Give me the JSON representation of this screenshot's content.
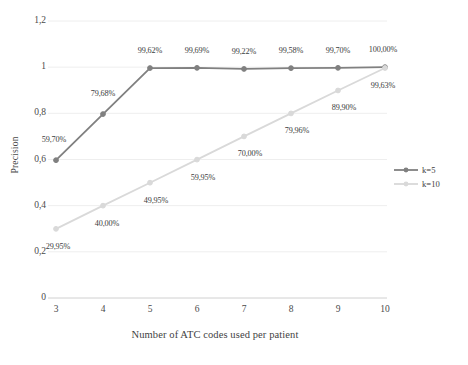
{
  "chart_data": {
    "type": "line",
    "title": "",
    "xlabel": "Number of ATC codes used per patient",
    "ylabel": "Precision",
    "x": [
      3,
      4,
      5,
      6,
      7,
      8,
      9,
      10
    ],
    "categories": [
      "3",
      "4",
      "5",
      "6",
      "7",
      "8",
      "9",
      "10"
    ],
    "xlim": [
      3,
      10
    ],
    "ylim": [
      0,
      1.2
    ],
    "yticks": [
      0,
      0.2,
      0.4,
      0.6,
      0.8,
      1,
      1.2
    ],
    "ytick_labels": [
      "0",
      "0,2",
      "0,4",
      "0,6",
      "0,8",
      "1",
      "1,2"
    ],
    "grid": "horizontal",
    "legend_position": "right",
    "series": [
      {
        "name": "k=5",
        "color": "#808080",
        "marker": "circle",
        "values": [
          0.597,
          0.7968,
          0.9962,
          0.9969,
          0.9922,
          0.9958,
          0.997,
          1.0
        ],
        "labels": [
          "59,70%",
          "79,68%",
          "99,62%",
          "99,69%",
          "99,22%",
          "99,58%",
          "99,70%",
          "100,00%"
        ],
        "label_offsets": [
          {
            "dx": -2,
            "dy": -20
          },
          {
            "dx": 0,
            "dy": -20
          },
          {
            "dx": 0,
            "dy": -17
          },
          {
            "dx": 0,
            "dy": -17
          },
          {
            "dx": 0,
            "dy": -17
          },
          {
            "dx": 0,
            "dy": -17
          },
          {
            "dx": 0,
            "dy": -17
          },
          {
            "dx": -2,
            "dy": -17
          }
        ]
      },
      {
        "name": "k=10",
        "color": "#d9d9d9",
        "marker": "circle",
        "values": [
          0.2995,
          0.4,
          0.4995,
          0.5995,
          0.7,
          0.7996,
          0.899,
          0.9963
        ],
        "labels": [
          "29,95%",
          "40,00%",
          "49,95%",
          "59,95%",
          "70,00%",
          "79,96%",
          "89,90%",
          "99,63%"
        ],
        "label_offsets": [
          {
            "dx": 2,
            "dy": 18
          },
          {
            "dx": 4,
            "dy": 18
          },
          {
            "dx": 6,
            "dy": 18
          },
          {
            "dx": 6,
            "dy": 18
          },
          {
            "dx": 6,
            "dy": 18
          },
          {
            "dx": 6,
            "dy": 18
          },
          {
            "dx": 6,
            "dy": 18
          },
          {
            "dx": -2,
            "dy": 18
          }
        ]
      }
    ]
  },
  "legend": {
    "items": [
      {
        "label": "k=5",
        "color": "#808080"
      },
      {
        "label": "k=10",
        "color": "#d9d9d9"
      }
    ]
  },
  "axes": {
    "x_title": "Number of ATC codes used per patient",
    "y_title": "Precision"
  },
  "style": {
    "grid_color": "#eeeeee",
    "axis_line_color": "#d0d0d0",
    "background": "#ffffff"
  }
}
